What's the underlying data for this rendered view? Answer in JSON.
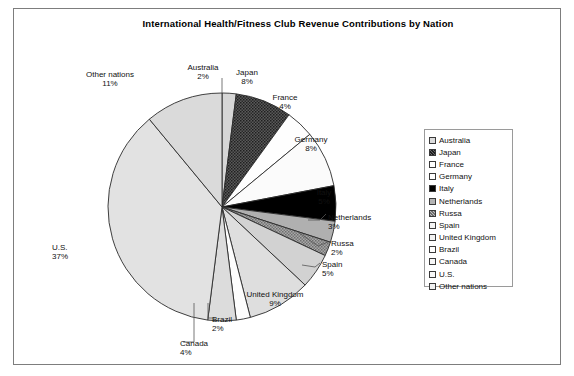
{
  "chart_data": {
    "type": "pie",
    "title": "International Health/Fitness Club Revenue Contributions by Nation",
    "xlabel": "",
    "ylabel": "",
    "grid": false,
    "legend_position": "right",
    "start_angle_deg": 90,
    "direction": "clockwise",
    "units": "percent",
    "categories": [
      "Australia",
      "Japan",
      "France",
      "Germany",
      "Italy",
      "Netherlands",
      "Russa",
      "Spain",
      "United Kingdom",
      "Brazil",
      "Canada",
      "U.S.",
      "Other nations"
    ],
    "values": [
      2,
      8,
      4,
      8,
      5,
      3,
      2,
      5,
      9,
      2,
      4,
      37,
      11
    ],
    "total": 100,
    "slices": [
      {
        "label": "Australia",
        "pct_text": "2%",
        "value": 2,
        "fill": "#d6d6d6",
        "pattern": "solid"
      },
      {
        "label": "Japan",
        "pct_text": "8%",
        "value": 8,
        "fill": "#4a4a4a",
        "pattern": "stipple-dark"
      },
      {
        "label": "France",
        "pct_text": "4%",
        "value": 4,
        "fill": "#fefefe",
        "pattern": "solid"
      },
      {
        "label": "Germany",
        "pct_text": "8%",
        "value": 8,
        "fill": "#fbfbfb",
        "pattern": "solid"
      },
      {
        "label": "Italy",
        "pct_text": "5%",
        "value": 5,
        "fill": "#000000",
        "pattern": "solid"
      },
      {
        "label": "Netherlands",
        "pct_text": "3%",
        "value": 3,
        "fill": "#b0b0b0",
        "pattern": "solid"
      },
      {
        "label": "Russa",
        "pct_text": "2%",
        "value": 2,
        "fill": "#8e8e8e",
        "pattern": "stipple-mid"
      },
      {
        "label": "Spain",
        "pct_text": "5%",
        "value": 5,
        "fill": "#d2d2d2",
        "pattern": "solid"
      },
      {
        "label": "United Kingdom",
        "pct_text": "9%",
        "value": 9,
        "fill": "#dedede",
        "pattern": "solid"
      },
      {
        "label": "Brazil",
        "pct_text": "2%",
        "value": 2,
        "fill": "#fdfdfd",
        "pattern": "solid"
      },
      {
        "label": "Canada",
        "pct_text": "4%",
        "value": 4,
        "fill": "#dcdcdc",
        "pattern": "solid"
      },
      {
        "label": "U.S.",
        "pct_text": "37%",
        "value": 37,
        "fill": "#e2e2e2",
        "pattern": "solid"
      },
      {
        "label": "Other nations",
        "pct_text": "11%",
        "value": 11,
        "fill": "#dadada",
        "pattern": "solid"
      }
    ]
  },
  "legend": {
    "items": [
      {
        "label": "Australia",
        "swatch": "#dcdcdc"
      },
      {
        "label": "Japan",
        "swatch": "#4f4f4f"
      },
      {
        "label": "France",
        "swatch": "#ffffff"
      },
      {
        "label": "Germany",
        "swatch": "#ffffff"
      },
      {
        "label": "Italy",
        "swatch": "#000000"
      },
      {
        "label": "Netherlands",
        "swatch": "#b4b4b4"
      },
      {
        "label": "Russa",
        "swatch": "#909090"
      },
      {
        "label": "Spain",
        "swatch": "#f4f4f4"
      },
      {
        "label": "United Kingdom",
        "swatch": "#f2f2f2"
      },
      {
        "label": "Brazil",
        "swatch": "#ffffff"
      },
      {
        "label": "Canada",
        "swatch": "#f6f6f6"
      },
      {
        "label": "U.S.",
        "swatch": "#f8f8f8"
      },
      {
        "label": "Other nations",
        "swatch": "#f0f0f0"
      }
    ]
  },
  "labels": [
    {
      "name": "other-nations",
      "title": "Other nations",
      "pct": "11%",
      "x": 110,
      "y": 70,
      "align": "c"
    },
    {
      "name": "australia",
      "title": "Australia",
      "pct": "2%",
      "x": 203,
      "y": 63,
      "align": "c"
    },
    {
      "name": "japan",
      "title": "Japan",
      "pct": "8%",
      "x": 247,
      "y": 68,
      "align": "c"
    },
    {
      "name": "france",
      "title": "France",
      "pct": "4%",
      "x": 285,
      "y": 93,
      "align": "c"
    },
    {
      "name": "germany",
      "title": "Germany",
      "pct": "8%",
      "x": 311,
      "y": 135,
      "align": "c"
    },
    {
      "name": "italy",
      "title": "Italy",
      "pct": "5%",
      "x": 324,
      "y": 188,
      "align": "c"
    },
    {
      "name": "netherlands",
      "title": "Netherlands",
      "pct": "3%",
      "x": 328,
      "y": 213,
      "align": "l"
    },
    {
      "name": "russa",
      "title": "Russa",
      "pct": "2%",
      "x": 331,
      "y": 239,
      "align": "l"
    },
    {
      "name": "spain",
      "title": "Spain",
      "pct": "5%",
      "x": 322,
      "y": 260,
      "align": "l"
    },
    {
      "name": "united-kingdom",
      "title": "United Kingdom",
      "pct": "9%",
      "x": 275,
      "y": 290,
      "align": "c"
    },
    {
      "name": "brazil",
      "title": "Brazil",
      "pct": "2%",
      "x": 212,
      "y": 315,
      "align": "l"
    },
    {
      "name": "canada",
      "title": "Canada",
      "pct": "4%",
      "x": 180,
      "y": 339,
      "align": "l"
    },
    {
      "name": "us",
      "title": "U.S.",
      "pct": "37%",
      "x": 52,
      "y": 243,
      "align": "l"
    }
  ],
  "geometry": {
    "cx": 222,
    "cy": 207,
    "r": 114
  },
  "leaders": [
    {
      "name": "leader-netherlands",
      "d": "M 308 220 L 320 220 L 326 214"
    },
    {
      "name": "leader-russa",
      "d": "M 298 232 L 318 246 L 328 242"
    },
    {
      "name": "leader-spain",
      "d": "M 302 265 L 315 267 L 320 263"
    },
    {
      "name": "leader-brazil",
      "d": "M 208 303 L 208 318 L 215 318"
    },
    {
      "name": "leader-canada",
      "d": "M 194 303 L 194 342 L 183 342"
    },
    {
      "name": "leader-australia",
      "d": "M 222 93 L 222 78"
    }
  ]
}
